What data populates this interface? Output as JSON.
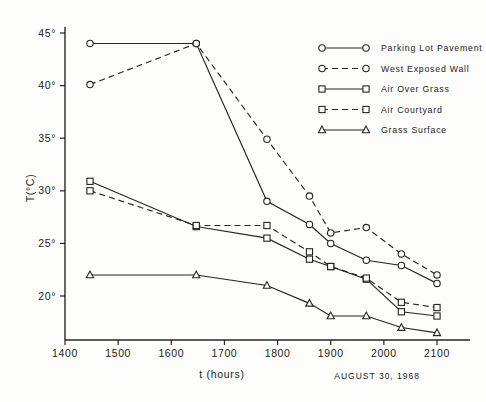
{
  "chart_data": {
    "type": "line",
    "title": "",
    "xlabel": "t (hours)",
    "ylabel": "T(°C)",
    "annotation": "AUGUST 30, 1968",
    "xlim": [
      1400,
      2130
    ],
    "ylim": [
      16,
      46
    ],
    "grid": false,
    "legend_position": "top-right",
    "xticks": [
      "1400",
      "1500",
      "1600",
      "1700",
      "1800",
      "1900",
      "2000",
      "2100"
    ],
    "xtick_values": [
      1400,
      1500,
      1600,
      1700,
      1800,
      1900,
      2000,
      2100
    ],
    "yticks": [
      "45°",
      "40°",
      "35°",
      "30°",
      "25°",
      "20°"
    ],
    "ytick_values": [
      45,
      40,
      35,
      30,
      25,
      20
    ],
    "series": [
      {
        "name": "Parking Lot Pavement",
        "marker": "circle",
        "linestyle": "solid",
        "x": [
          1447,
          1647,
          1780,
          1860,
          1900,
          1967,
          2033,
          2100
        ],
        "values": [
          44.0,
          44.0,
          29.0,
          26.8,
          25.0,
          23.4,
          22.9,
          21.2
        ]
      },
      {
        "name": "West Exposed Wall",
        "marker": "circle",
        "linestyle": "dashed",
        "x": [
          1447,
          1647,
          1780,
          1860,
          1900,
          1967,
          2033,
          2100
        ],
        "values": [
          40.1,
          44.0,
          34.9,
          29.5,
          26.0,
          26.5,
          24.0,
          22.0
        ]
      },
      {
        "name": "Air Over Grass",
        "marker": "square",
        "linestyle": "solid",
        "x": [
          1447,
          1647,
          1780,
          1860,
          1900,
          1967,
          2033,
          2100
        ],
        "values": [
          30.9,
          26.6,
          25.5,
          23.5,
          22.8,
          21.6,
          18.5,
          18.1
        ]
      },
      {
        "name": "Air Courtyard",
        "marker": "square",
        "linestyle": "dashed",
        "x": [
          1447,
          1647,
          1780,
          1860,
          1900,
          1967,
          2033,
          2100
        ],
        "values": [
          30.0,
          26.7,
          26.7,
          24.2,
          22.8,
          21.7,
          19.4,
          18.9
        ]
      },
      {
        "name": "Grass Surface",
        "marker": "triangle",
        "linestyle": "solid",
        "x": [
          1447,
          1647,
          1780,
          1860,
          1900,
          1967,
          2033,
          2100
        ],
        "values": [
          22.0,
          22.0,
          21.0,
          19.3,
          18.1,
          18.1,
          17.0,
          16.5
        ]
      }
    ]
  },
  "legend": {
    "entries": [
      {
        "label": "Parking Lot Pavement"
      },
      {
        "label": "West Exposed Wall"
      },
      {
        "label": "Air Over Grass"
      },
      {
        "label": "Air Courtyard"
      },
      {
        "label": "Grass Surface"
      }
    ]
  },
  "axes": {
    "y_title": "T(°C)",
    "x_title": "t (hours)",
    "date_annotation": "AUGUST 30, 1968"
  }
}
